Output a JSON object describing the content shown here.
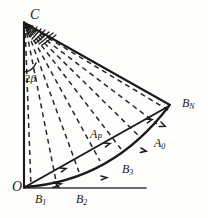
{
  "figure": {
    "type": "geometric-diagram",
    "background_color": "#fdfdfc",
    "stroke_color": "#1a1a1a",
    "labels": [
      {
        "id": "C",
        "text": "C",
        "sub": "",
        "role": "apex-vertex"
      },
      {
        "id": "O",
        "text": "O",
        "sub": "",
        "role": "origin-vertex"
      },
      {
        "id": "BN",
        "text": "B",
        "sub": "N",
        "role": "right-vertex"
      },
      {
        "id": "AP",
        "text": "A",
        "sub": "P",
        "role": "arc-point"
      },
      {
        "id": "A0",
        "text": "A",
        "sub": "0",
        "role": "arc-point"
      },
      {
        "id": "B3",
        "text": "B",
        "sub": "3",
        "role": "arc-point"
      },
      {
        "id": "B1",
        "text": "B",
        "sub": "1",
        "role": "baseline-point"
      },
      {
        "id": "B2",
        "text": "B",
        "sub": "2",
        "role": "baseline-point"
      },
      {
        "id": "2b",
        "text": "2",
        "sub": "",
        "greek": "β",
        "role": "angle-label"
      }
    ],
    "geometry": {
      "apex_C": [
        24,
        22
      ],
      "origin_O": [
        24,
        188
      ],
      "vertex_BN": [
        170,
        105
      ],
      "baseline_end": [
        146,
        188
      ],
      "ray_count": 8,
      "arc_tick_count": 4,
      "chord_tick_count": 3
    }
  }
}
